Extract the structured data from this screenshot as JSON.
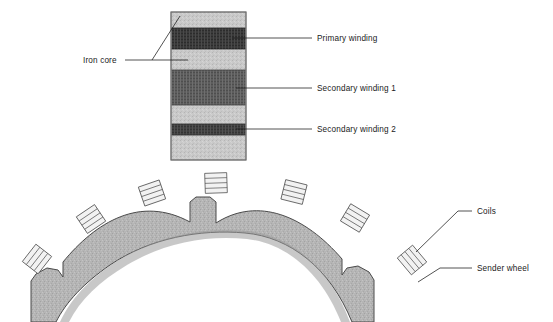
{
  "diagram": {
    "background_color": "#ffffff",
    "line_color": "#1a1a1a",
    "text_color": "#1a1a1a"
  },
  "transformer": {
    "name": "transformer-core-stack",
    "core_color": "#c9c9c9",
    "core_bounds": {
      "x": 171,
      "y": 12,
      "width": 75,
      "height": 148
    },
    "layers": [
      {
        "id": "iron-core",
        "label": "Iron core",
        "color": "#c9c9c9",
        "kind": "core"
      },
      {
        "id": "primary-winding",
        "label": "Primary winding",
        "color": "#3a3a3a",
        "kind": "winding",
        "y": 28,
        "height": 21
      },
      {
        "id": "secondary-winding-1",
        "label": "Secondary winding 1",
        "color": "#5a5a5a",
        "kind": "winding",
        "y": 70,
        "height": 35
      },
      {
        "id": "secondary-winding-2",
        "label": "Secondary winding 2",
        "color": "#3f3f3f",
        "kind": "winding",
        "y": 124,
        "height": 11
      }
    ]
  },
  "sender_wheel": {
    "name": "sender-wheel-arc",
    "label": "Sender wheel",
    "fill_color": "#b5b5b5",
    "stroke_color": "#4a4a4a",
    "notch_count": 3
  },
  "coils": {
    "label": "Coils",
    "count": 7,
    "fill_color": "#f2f2f2",
    "stroke_color": "#555555",
    "stripe_count": 4,
    "items": [
      {
        "id": "coil-1",
        "cx": 37,
        "cy": 259,
        "rotation": -52
      },
      {
        "id": "coil-2",
        "cx": 91,
        "cy": 219,
        "rotation": -34
      },
      {
        "id": "coil-3",
        "cx": 152,
        "cy": 193,
        "rotation": -19
      },
      {
        "id": "coil-4",
        "cx": 216,
        "cy": 183,
        "rotation": -2
      },
      {
        "id": "coil-5",
        "cx": 294,
        "cy": 192,
        "rotation": 14
      },
      {
        "id": "coil-6",
        "cx": 355,
        "cy": 218,
        "rotation": 31
      },
      {
        "id": "coil-7",
        "cx": 412,
        "cy": 260,
        "rotation": 50
      }
    ]
  },
  "labels": {
    "iron_core": {
      "text": "Iron core",
      "x": 83,
      "y": 63,
      "anchor": "start"
    },
    "primary_winding": {
      "text": "Primary winding",
      "x": 317,
      "y": 42,
      "anchor": "start"
    },
    "secondary_winding_1": {
      "text": "Secondary winding 1",
      "x": 317,
      "y": 92,
      "anchor": "start"
    },
    "secondary_winding_2": {
      "text": "Secondary winding 2",
      "x": 317,
      "y": 132,
      "anchor": "start"
    },
    "coils": {
      "text": "Coils",
      "x": 477,
      "y": 215,
      "anchor": "start"
    },
    "sender_wheel": {
      "text": "Sender wheel",
      "x": 477,
      "y": 272,
      "anchor": "start"
    }
  }
}
